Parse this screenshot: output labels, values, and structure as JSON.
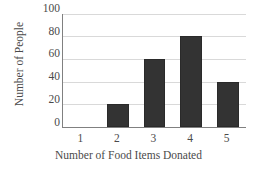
{
  "chart_data": {
    "type": "bar",
    "title": "",
    "xlabel": "Number of Food Items Donated",
    "ylabel": "Number of People",
    "categories": [
      "1",
      "2",
      "3",
      "4",
      "5"
    ],
    "values": [
      0,
      20,
      60,
      80,
      40
    ],
    "ylim": [
      0,
      100
    ],
    "yticks": [
      "0",
      "20",
      "40",
      "60",
      "80",
      "100"
    ],
    "ytick_values": [
      0,
      20,
      40,
      60,
      80,
      100
    ],
    "grid": "horizontal",
    "legend": "none",
    "bar_color": "#333333",
    "gridline_color": "#d9d9d9",
    "axis_color": "#808080",
    "background_color": "#ffffff"
  }
}
